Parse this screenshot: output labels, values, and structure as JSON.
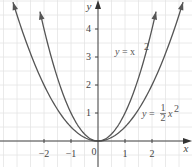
{
  "chart_data": {
    "type": "line",
    "title": "",
    "xlabel": "x",
    "ylabel": "y",
    "xlim": [
      -3.6,
      3.5
    ],
    "ylim": [
      -0.9,
      5.0
    ],
    "grid": true,
    "grid_step": 0.5,
    "xticks": [
      -2,
      -1,
      0,
      1,
      2
    ],
    "xtick_labels": [
      "−2",
      "−1",
      "0",
      "1",
      "2"
    ],
    "yticks": [
      1,
      2,
      3,
      4
    ],
    "ytick_labels": [
      "1",
      "2",
      "3",
      "4"
    ],
    "series": [
      {
        "name": "y = x²",
        "function": "x^2",
        "x": [
          -2.15,
          -2,
          -1.5,
          -1,
          -0.5,
          0,
          0.5,
          1,
          1.5,
          2,
          2.15
        ],
        "values": [
          4.62,
          4,
          2.25,
          1,
          0.25,
          0,
          0.25,
          1,
          2.25,
          4,
          4.62
        ],
        "color": "#555555"
      },
      {
        "name": "y = ½x²",
        "function": "0.5*x^2",
        "x": [
          -3.15,
          -3,
          -2,
          -1,
          0,
          1,
          2,
          3,
          3.15
        ],
        "values": [
          4.96,
          4.5,
          2,
          0.5,
          0,
          0.5,
          2,
          4.5,
          4.96
        ],
        "color": "#555555"
      }
    ],
    "annotations": [
      {
        "text": "y = x²",
        "x": 1.4,
        "y": 3.1
      },
      {
        "text": "y = ½x²",
        "x": 2.5,
        "y": 0.9
      }
    ]
  },
  "labels": {
    "x_axis": "x",
    "y_axis": "y",
    "origin": "0",
    "curve1_y": "y",
    "curve1_eq": " = x",
    "curve1_exp": "2",
    "curve2_y": "y",
    "curve2_eq": " = ",
    "curve2_num": "1",
    "curve2_den": "2",
    "curve2_x": "x",
    "curve2_exp": "2",
    "x_ticks": [
      "−2",
      "−1",
      "1",
      "2"
    ],
    "y_ticks": [
      "1",
      "2",
      "3",
      "4"
    ]
  },
  "colors": {
    "grid": "#e4e4e4",
    "axis": "#444444",
    "curve": "#5a5a5a"
  }
}
